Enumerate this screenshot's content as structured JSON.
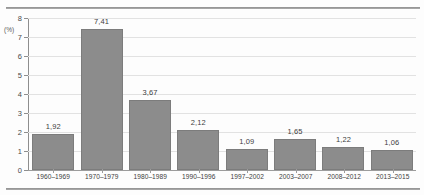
{
  "chart_data": {
    "type": "bar",
    "title": "",
    "xlabel": "",
    "ylabel": "(%)",
    "unit_label": "(%)",
    "ylim": [
      0,
      8
    ],
    "ytick_labels": [
      "8",
      "7",
      "6",
      "5",
      "4",
      "3",
      "2",
      "1",
      "0"
    ],
    "yticks": [
      8,
      7,
      6,
      5,
      4,
      3,
      2,
      1,
      0
    ],
    "grid": true,
    "legend": "none",
    "categories": [
      "1960–1969",
      "1970–1979",
      "1980–1989",
      "1990–1996",
      "1997–2002",
      "2003–2007",
      "2008–2012",
      "2013–2015"
    ],
    "values": [
      1.92,
      7.41,
      3.67,
      2.12,
      1.09,
      1.65,
      1.22,
      1.06
    ],
    "value_labels": [
      "1,92",
      "7,41",
      "3,67",
      "2,12",
      "1,09",
      "1,65",
      "1,22",
      "1,06"
    ],
    "bar_color": "#8c8c8c",
    "bar_border_color": "#7c7c7c",
    "grid_color": "#e2e2e2",
    "axis_color": "#8e8e8e"
  }
}
